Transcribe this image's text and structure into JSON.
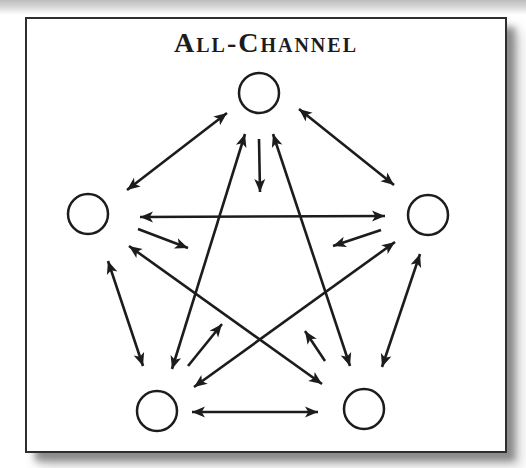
{
  "figure": {
    "title": "All-Channel",
    "ink_color": "#1c1c1c",
    "background_color": "#ffffff",
    "border_color": "#2e2e2e"
  },
  "diagram": {
    "type": "network",
    "node_radius": 20,
    "line_width": 2.6,
    "nodes": [
      {
        "id": "top",
        "x": 232,
        "y": 74
      },
      {
        "id": "left",
        "x": 61,
        "y": 195
      },
      {
        "id": "right",
        "x": 401,
        "y": 196
      },
      {
        "id": "bottom-left",
        "x": 130,
        "y": 392
      },
      {
        "id": "bottom-right",
        "x": 337,
        "y": 390
      }
    ],
    "edges": [
      {
        "from": "top",
        "to": "left",
        "x1": 200,
        "y1": 94,
        "x2": 100,
        "y2": 171,
        "bidirectional": true
      },
      {
        "from": "top",
        "to": "right",
        "x1": 272,
        "y1": 90,
        "x2": 367,
        "y2": 166,
        "bidirectional": true
      },
      {
        "from": "left",
        "to": "right",
        "x1": 113,
        "y1": 198,
        "x2": 358,
        "y2": 197,
        "bidirectional": true
      },
      {
        "from": "top",
        "to": "bottom-left",
        "x1": 218,
        "y1": 115,
        "x2": 145,
        "y2": 350,
        "bidirectional": true
      },
      {
        "from": "top",
        "to": "bottom-right",
        "x1": 246,
        "y1": 115,
        "x2": 323,
        "y2": 347,
        "bidirectional": true
      },
      {
        "from": "left",
        "to": "bottom-left",
        "x1": 81,
        "y1": 242,
        "x2": 116,
        "y2": 347,
        "bidirectional": true
      },
      {
        "from": "right",
        "to": "bottom-right",
        "x1": 393,
        "y1": 235,
        "x2": 355,
        "y2": 348,
        "bidirectional": true
      },
      {
        "from": "bottom-left",
        "to": "bottom-right",
        "x1": 165,
        "y1": 393,
        "x2": 291,
        "y2": 393,
        "bidirectional": true
      },
      {
        "from": "left",
        "to": "bottom-right",
        "x1": 102,
        "y1": 227,
        "x2": 295,
        "y2": 365,
        "bidirectional": true
      },
      {
        "from": "right",
        "to": "bottom-left",
        "x1": 368,
        "y1": 223,
        "x2": 167,
        "y2": 368,
        "bidirectional": true
      }
    ],
    "stub_arrows": [
      {
        "at": "top",
        "x1": 232,
        "y1": 120,
        "x2": 233,
        "y2": 173
      },
      {
        "at": "left",
        "x1": 111,
        "y1": 210,
        "x2": 161,
        "y2": 229
      },
      {
        "at": "right",
        "x1": 354,
        "y1": 211,
        "x2": 306,
        "y2": 227
      },
      {
        "at": "bottom-left",
        "x1": 161,
        "y1": 347,
        "x2": 195,
        "y2": 305
      },
      {
        "at": "bottom-right",
        "x1": 298,
        "y1": 342,
        "x2": 278,
        "y2": 312
      }
    ]
  }
}
